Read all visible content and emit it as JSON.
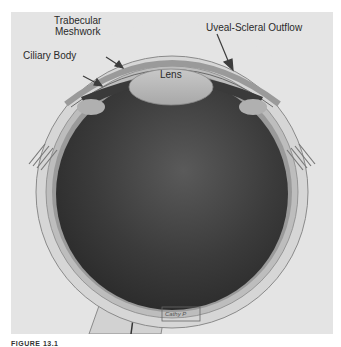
{
  "figure": {
    "labels": {
      "trabecular_meshwork_line1": "Trabecular",
      "trabecular_meshwork_line2": "Meshwork",
      "ciliary_body": "Ciliary Body",
      "uveal_scleral_outflow": "Uveal-Scleral Outflow",
      "lens": "Lens"
    },
    "signature": "Cathy P",
    "caption": "FIGURE 13.1"
  },
  "colors": {
    "background": "#e4e4e4",
    "vitreous": "#3a3a3a",
    "sclera": "#cfcfcf",
    "lens": "#b8b8b8",
    "arrow": "#3c3c3c"
  }
}
